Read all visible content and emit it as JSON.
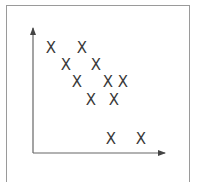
{
  "chart_data": {
    "type": "scatter",
    "title": "",
    "xlabel": "",
    "ylabel": "",
    "marker": "X",
    "grid": false,
    "legend": null,
    "axes": {
      "arrows": true,
      "ticks": false
    },
    "points": [
      {
        "x": 1.0,
        "y": 5.8
      },
      {
        "x": 2.8,
        "y": 5.8
      },
      {
        "x": 1.9,
        "y": 4.9
      },
      {
        "x": 3.5,
        "y": 4.9
      },
      {
        "x": 2.5,
        "y": 4.0
      },
      {
        "x": 4.2,
        "y": 4.0
      },
      {
        "x": 5.0,
        "y": 4.0
      },
      {
        "x": 3.2,
        "y": 3.0
      },
      {
        "x": 4.5,
        "y": 3.0
      },
      {
        "x": 4.3,
        "y": 0.8
      },
      {
        "x": 6.0,
        "y": 0.8
      }
    ],
    "colors": {
      "marker": "#3a3a3a",
      "axis": "#555555",
      "frame": "#9a9a9a"
    }
  },
  "pixel_points": [
    [
      51,
      48
    ],
    [
      82,
      48
    ],
    [
      66,
      65
    ],
    [
      96,
      65
    ],
    [
      77,
      82
    ],
    [
      108,
      82
    ],
    [
      123,
      82
    ],
    [
      91,
      100
    ],
    [
      114,
      100
    ],
    [
      111,
      139
    ],
    [
      141,
      139
    ]
  ],
  "marker_glyph": "X"
}
